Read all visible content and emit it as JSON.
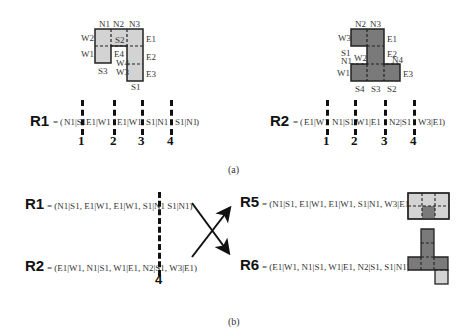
{
  "part_a": {
    "caption": "(a)",
    "shape_left": {
      "labels": {
        "N1": "N1",
        "N2": "N2",
        "N3": "N3",
        "W2": "W2",
        "W1": "W1",
        "W4": "W4",
        "W3": "W3",
        "S2": "S2",
        "S3": "S3",
        "S1": "S1",
        "E1": "E1",
        "E4": "E4",
        "E2": "E2",
        "E3": "E3"
      },
      "fill": "#d3d3d3"
    },
    "shape_right": {
      "labels": {
        "N2": "N2",
        "N3": "N3",
        "W3": "W3",
        "E1": "E1",
        "S1": "S1",
        "W2": "W2",
        "N1": "N1",
        "E2": "E2",
        "N4": "N4",
        "W1": "W1",
        "E3": "E3",
        "S4": "S4",
        "S3": "S3",
        "S2": "S2"
      },
      "fill": "#7a7a7a"
    },
    "r1": {
      "name": "R1",
      "equals": "=",
      "open": "(",
      "close": ")",
      "genes": [
        "N1|S1",
        "E1|W1",
        "E1|W1",
        "S1|N1",
        "S1|N1"
      ],
      "cut_numbers": [
        "1",
        "2",
        "3",
        "4"
      ]
    },
    "r2": {
      "name": "R2",
      "equals": "=",
      "open": "(",
      "close": ")",
      "genes": [
        "E1|W1",
        "N1|S1",
        "W1|E1",
        "N2|S1",
        "W3|E1"
      ],
      "cut_numbers": [
        "1",
        "2",
        "3",
        "4"
      ]
    }
  },
  "part_b": {
    "caption": "(b)",
    "r1": {
      "name": "R1",
      "expr": "= (N1|S1, E1|W1, E1|W1,  S1|N1 S1|N1)"
    },
    "r2": {
      "name": "R2",
      "expr": "= (E1|W1, N1|S1, W1|E1,  N2|S1, W3|E1)"
    },
    "cut_number": "4",
    "r5": {
      "name": "R5",
      "expr": "= (N1|S1, E1|W1, E1|W1, S1|N1, W3|E1)"
    },
    "r6": {
      "name": "R6",
      "expr": "= (E1|W1, N1|S1, W1|E1, N2|S1, S1|N1)"
    }
  },
  "colors": {
    "light": "#d3d3d3",
    "dark": "#7a7a7a",
    "line": "#222222"
  }
}
